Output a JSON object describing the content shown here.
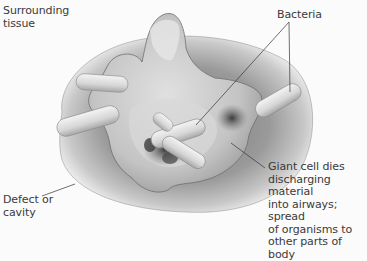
{
  "figure": {
    "type": "medical-illustration",
    "colors": {
      "background": "#fbfbfb",
      "tissue_outer": "#8a8a8a",
      "tissue_inner": "#b8b8b8",
      "cell_surface": "#d4d4d4",
      "bacteria": "#e2e2e2",
      "dark_region": "#4a4a4a",
      "leader_line": "#333333",
      "text": "#3a3a3a"
    }
  },
  "labels": {
    "surrounding_tissue": "Surrounding\ntissue",
    "bacteria": "Bacteria",
    "giant_cell": "Giant cell dies\ndischarging material\ninto airways; spread\nof organisms to\nother parts of body",
    "defect": "Defect or\ncavity"
  }
}
